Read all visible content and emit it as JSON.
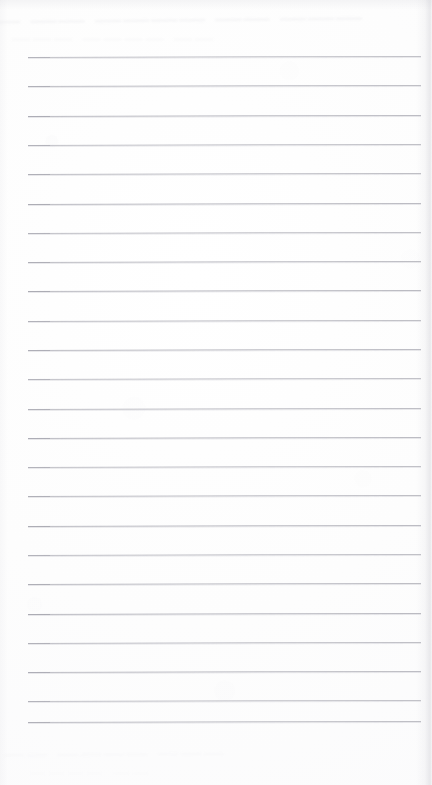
{
  "document": {
    "kind": "scanned-lined-paper",
    "title": "Blank ruled notebook page",
    "page_width": 432,
    "page_height": 785,
    "background_color": "#fdfdfd",
    "has_text_content": false,
    "written_content": ""
  },
  "ruling": {
    "line_count": 24,
    "line_color": "#b9b9c0",
    "line_thickness_px": 1,
    "first_line_y": 57,
    "line_spacing_px": 29.3,
    "left_margin_x": 28,
    "right_margin_x": 421,
    "line_length_px": 393,
    "skew_degrees": -0.16,
    "line_y_positions": [
      57,
      86,
      116,
      145,
      174,
      204,
      233,
      262,
      291,
      321,
      350,
      379,
      409,
      438,
      467,
      496,
      526,
      555,
      584,
      614,
      643,
      672,
      701,
      722
    ]
  },
  "artifacts": {
    "ghost_top_line1": "— —— ———— —— ———",
    "ghost_top_line2": "———  ————  ——",
    "ghost_bottom_line1": "——  ————  ———",
    "ghost_bottom_line2": "————  ——",
    "right_edge_shadow": true,
    "top_edge_shadow": true
  }
}
